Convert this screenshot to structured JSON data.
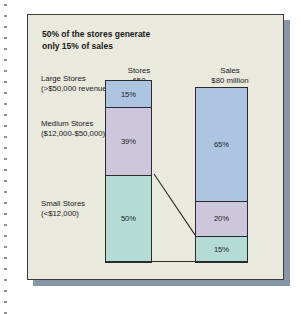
{
  "chart_title": "50% of the stores generate\nonly 15% of sales",
  "categories": {
    "large": "Large Stores\n(>$50,000 revenues)",
    "medium": "Medium Stores\n($12,000-$50,000)",
    "small": "Small Stores\n(<$12,000)"
  },
  "columns": {
    "stores_header": "Stores\n650",
    "sales_header": "Sales\n$80 million"
  },
  "segments": {
    "stores_large": "15%",
    "stores_medium": "39%",
    "stores_small": "50%",
    "sales_large": "65%",
    "sales_medium": "20%",
    "sales_small": "15%"
  },
  "colors": {
    "large": "#aec5e1",
    "medium": "#ccc7dc",
    "small": "#b5dbd5",
    "panel_background": "#e9e9de",
    "panel_border": "#3b3b3b",
    "shadow": "#8897a8",
    "text": "#1a1a1a"
  },
  "chart_data": {
    "type": "bar",
    "title": "50% of the stores generate only 15% of sales",
    "subtitle": "",
    "xlabel": "",
    "ylabel": "",
    "ylim": [
      0,
      100
    ],
    "grid": false,
    "legend_position": "left-labels",
    "stacked": true,
    "categories": [
      "Stores 650",
      "Sales $80 million"
    ],
    "series": [
      {
        "name": "Large Stores (>$50,000 revenues)",
        "values": [
          15,
          65
        ],
        "color": "#aec5e1"
      },
      {
        "name": "Medium Stores ($12,000-$50,000)",
        "values": [
          39,
          20
        ],
        "color": "#ccc7dc"
      },
      {
        "name": "Small Stores (<$12,000)",
        "values": [
          50,
          15
        ],
        "color": "#b5dbd5"
      }
    ],
    "column_totals": [
      "650 stores",
      "$80 million"
    ],
    "data_labels": [
      "15%",
      "39%",
      "50%",
      "65%",
      "20%",
      "15%"
    ],
    "annotations": [
      "Connector line linking Stores small-segment top boundary to Sales small-segment top boundary"
    ]
  }
}
